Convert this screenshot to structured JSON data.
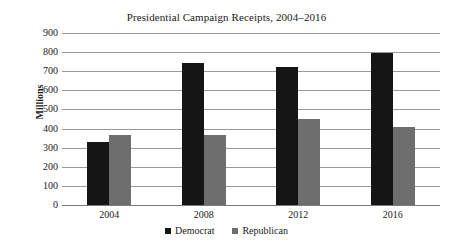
{
  "chart_data": {
    "type": "bar",
    "title": "Presidential Campaign Receipts, 2004–2016",
    "xlabel": "",
    "ylabel": "Millions",
    "categories": [
      "2004",
      "2008",
      "2012",
      "2016"
    ],
    "series": [
      {
        "name": "Democrat",
        "color": "#151515",
        "values": [
          330,
          745,
          722,
          798
        ]
      },
      {
        "name": "Republican",
        "color": "#6e6e6e",
        "values": [
          367,
          367,
          450,
          410
        ]
      }
    ],
    "ylim": [
      0,
      900
    ],
    "ytick_step": 100,
    "ytick_labels": [
      "900",
      "800",
      "700",
      "600",
      "500",
      "400",
      "300",
      "200",
      "100",
      "0"
    ],
    "grid": true,
    "grid_color": "#9a9a9a",
    "legend_position": "bottom",
    "legend_entries": [
      "Democrat",
      "Republican"
    ]
  }
}
